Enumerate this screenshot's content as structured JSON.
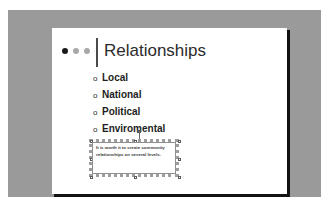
{
  "slide": {
    "title": "Relationships",
    "title_decoration": {
      "dots": [
        "dot-dark",
        "dot-light",
        "dot-light"
      ],
      "rule": "vertical-divider"
    },
    "bullets": [
      {
        "marker": "o",
        "label": "Local"
      },
      {
        "marker": "o",
        "label": "National"
      },
      {
        "marker": "o",
        "label": "Political"
      },
      {
        "marker": "o",
        "label": "Enviromental"
      }
    ],
    "callout": {
      "text": "It is worth it to create community relationships on several levels.",
      "selected": true
    }
  },
  "colors": {
    "workspace": "#9a9a9a",
    "slide": "#ffffff",
    "shadow": "#121212",
    "title_text": "#2b2b2b",
    "bullet_text": "#1d1d1d",
    "callout_text": "#3a3a3a",
    "dot_dark": "#1a1a1a",
    "dot_light": "#a8a8a8",
    "selection_frame": "#9d9d9d"
  }
}
